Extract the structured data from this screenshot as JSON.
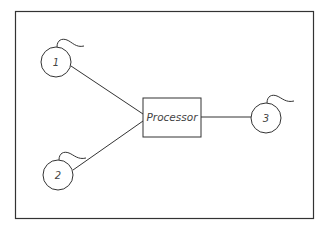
{
  "diagram": {
    "processor": {
      "label": "Processor"
    },
    "nodes": [
      {
        "id": "node-1",
        "label": "1"
      },
      {
        "id": "node-2",
        "label": "2"
      },
      {
        "id": "node-3",
        "label": "3"
      }
    ],
    "colors": {
      "stroke": "#333333",
      "background": "#ffffff"
    }
  }
}
